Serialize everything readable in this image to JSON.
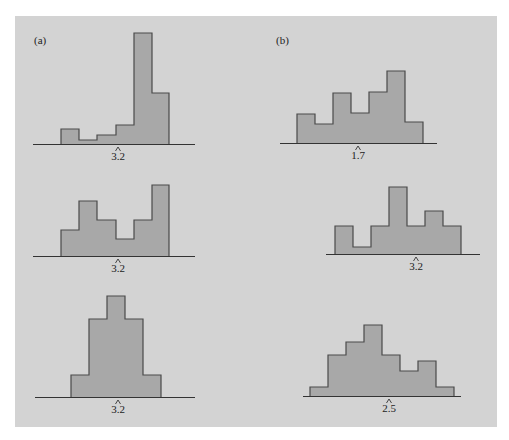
{
  "figure": {
    "panel_labels": [
      "(a)",
      "(b)"
    ],
    "colors": {
      "background": "#d3d3d3",
      "bar_fill": "#a8a8a8",
      "bar_stroke": "#4a4a4a",
      "axis": "#333333"
    }
  },
  "chart_data": [
    {
      "id": "a-top",
      "column": "(a)",
      "row": 1,
      "type": "bar",
      "title": "",
      "xlabel": "",
      "ylabel": "",
      "marker_label": "3.2",
      "marker_x": 118,
      "axis": {
        "x1": 33,
        "x2": 195,
        "y": 144
      },
      "bins": [
        {
          "x": 61,
          "w": 18,
          "top": 129
        },
        {
          "x": 79,
          "w": 18,
          "top": 140
        },
        {
          "x": 97,
          "w": 19,
          "top": 135
        },
        {
          "x": 116,
          "w": 18,
          "top": 125
        },
        {
          "x": 134,
          "w": 18,
          "top": 33
        },
        {
          "x": 152,
          "w": 17,
          "top": 93
        }
      ],
      "relative_heights": [
        15,
        4,
        9,
        19,
        111,
        51
      ],
      "shape": "left-skewed"
    },
    {
      "id": "a-middle",
      "column": "(a)",
      "row": 2,
      "type": "bar",
      "title": "",
      "xlabel": "",
      "ylabel": "",
      "marker_label": "3.2",
      "marker_x": 118,
      "axis": {
        "x1": 33,
        "x2": 195,
        "y": 256
      },
      "bins": [
        {
          "x": 61,
          "w": 18,
          "top": 230
        },
        {
          "x": 79,
          "w": 18,
          "top": 201
        },
        {
          "x": 97,
          "w": 19,
          "top": 220
        },
        {
          "x": 116,
          "w": 18,
          "top": 239
        },
        {
          "x": 134,
          "w": 18,
          "top": 220
        },
        {
          "x": 152,
          "w": 17,
          "top": 185
        }
      ],
      "relative_heights": [
        26,
        55,
        36,
        17,
        36,
        71
      ],
      "shape": "irregular"
    },
    {
      "id": "a-bottom",
      "column": "(a)",
      "row": 3,
      "type": "bar",
      "title": "",
      "xlabel": "",
      "ylabel": "",
      "marker_label": "3.2",
      "marker_x": 118,
      "axis": {
        "x1": 35,
        "x2": 195,
        "y": 397
      },
      "bins": [
        {
          "x": 71,
          "w": 18,
          "top": 375
        },
        {
          "x": 89,
          "w": 18,
          "top": 319
        },
        {
          "x": 107,
          "w": 18,
          "top": 296
        },
        {
          "x": 125,
          "w": 18,
          "top": 319
        },
        {
          "x": 143,
          "w": 18,
          "top": 375
        }
      ],
      "relative_heights": [
        22,
        78,
        101,
        78,
        22
      ],
      "shape": "symmetric"
    },
    {
      "id": "b-top",
      "column": "(b)",
      "row": 1,
      "type": "bar",
      "title": "",
      "xlabel": "",
      "ylabel": "",
      "marker_label": "1.7",
      "marker_x": 358,
      "axis": {
        "x1": 280,
        "x2": 437,
        "y": 143
      },
      "bins": [
        {
          "x": 297,
          "w": 18,
          "top": 114
        },
        {
          "x": 315,
          "w": 18,
          "top": 124
        },
        {
          "x": 333,
          "w": 18,
          "top": 93
        },
        {
          "x": 351,
          "w": 18,
          "top": 113
        },
        {
          "x": 369,
          "w": 18,
          "top": 92
        },
        {
          "x": 387,
          "w": 18,
          "top": 71
        },
        {
          "x": 405,
          "w": 18,
          "top": 122
        }
      ],
      "relative_heights": [
        29,
        19,
        50,
        30,
        51,
        72,
        21
      ],
      "shape": "irregular"
    },
    {
      "id": "b-middle",
      "column": "(b)",
      "row": 2,
      "type": "bar",
      "title": "",
      "xlabel": "",
      "ylabel": "",
      "marker_label": "3.2",
      "marker_x": 416,
      "axis": {
        "x1": 326,
        "x2": 480,
        "y": 254
      },
      "bins": [
        {
          "x": 335,
          "w": 18,
          "top": 226
        },
        {
          "x": 353,
          "w": 18,
          "top": 247
        },
        {
          "x": 371,
          "w": 18,
          "top": 226
        },
        {
          "x": 389,
          "w": 18,
          "top": 187
        },
        {
          "x": 407,
          "w": 18,
          "top": 226
        },
        {
          "x": 425,
          "w": 18,
          "top": 211
        },
        {
          "x": 443,
          "w": 18,
          "top": 226
        }
      ],
      "relative_heights": [
        28,
        7,
        28,
        67,
        28,
        43,
        28
      ],
      "shape": "irregular"
    },
    {
      "id": "b-bottom",
      "column": "(b)",
      "row": 3,
      "type": "bar",
      "title": "",
      "xlabel": "",
      "ylabel": "",
      "marker_label": "2.5",
      "marker_x": 389,
      "axis": {
        "x1": 303,
        "x2": 461,
        "y": 396
      },
      "bins": [
        {
          "x": 310,
          "w": 18,
          "top": 387
        },
        {
          "x": 328,
          "w": 18,
          "top": 355
        },
        {
          "x": 346,
          "w": 18,
          "top": 342
        },
        {
          "x": 364,
          "w": 18,
          "top": 325
        },
        {
          "x": 382,
          "w": 18,
          "top": 355
        },
        {
          "x": 400,
          "w": 18,
          "top": 371
        },
        {
          "x": 418,
          "w": 18,
          "top": 361
        },
        {
          "x": 436,
          "w": 18,
          "top": 387
        }
      ],
      "relative_heights": [
        9,
        41,
        54,
        71,
        41,
        25,
        35,
        9
      ],
      "shape": "right-skewed"
    }
  ]
}
